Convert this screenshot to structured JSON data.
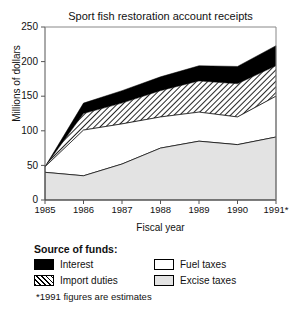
{
  "chart_data": {
    "type": "area",
    "title": "Sport fish restoration account receipts",
    "xlabel": "Fiscal year",
    "ylabel": "Millions of dollars",
    "categories": [
      "1985",
      "1986",
      "1987",
      "1988",
      "1989",
      "1990",
      "1991*"
    ],
    "x_tick_labels": [
      "1985",
      "1986",
      "1987",
      "1988",
      "1989",
      "1990",
      "1991*"
    ],
    "y_tick_labels": [
      "0",
      "50",
      "100",
      "150",
      "200",
      "250"
    ],
    "ylim": [
      0,
      250
    ],
    "ytick_step": 50,
    "grid": false,
    "stacked": true,
    "legend_position": "below",
    "legend_title": "Source of funds:",
    "footnote": "*1991 figures are estimates",
    "series": [
      {
        "name": "Excise taxes",
        "order": 1,
        "fill": "light-gray",
        "color": "#e3e3e3",
        "values": [
          40,
          35,
          52,
          75,
          85,
          80,
          91
        ]
      },
      {
        "name": "Fuel taxes",
        "order": 2,
        "fill": "white",
        "color": "#ffffff",
        "values": [
          8,
          66,
          58,
          45,
          42,
          40,
          59
        ]
      },
      {
        "name": "Import duties",
        "order": 3,
        "fill": "diagonal-hatch",
        "color": "#000000",
        "values": [
          0,
          24,
          30,
          38,
          45,
          48,
          44
        ]
      },
      {
        "name": "Interest",
        "order": 4,
        "fill": "black",
        "color": "#000000",
        "values": [
          0,
          15,
          18,
          20,
          22,
          25,
          29
        ]
      }
    ],
    "cumulative_tops": {
      "excise_taxes": [
        40,
        35,
        52,
        75,
        85,
        80,
        91
      ],
      "fuel_taxes": [
        48,
        101,
        110,
        120,
        127,
        120,
        150
      ],
      "import_duties": [
        48,
        125,
        140,
        158,
        172,
        168,
        194
      ],
      "interest": [
        48,
        140,
        158,
        178,
        194,
        193,
        223
      ]
    }
  },
  "legend": {
    "title": "Source of funds:",
    "items": [
      {
        "label": "Interest",
        "icon": "black-swatch"
      },
      {
        "label": "Import duties",
        "icon": "hatched-swatch"
      },
      {
        "label": "Fuel taxes",
        "icon": "white-swatch"
      },
      {
        "label": "Excise taxes",
        "icon": "gray-swatch"
      }
    ],
    "footnote": "*1991 figures are estimates"
  }
}
